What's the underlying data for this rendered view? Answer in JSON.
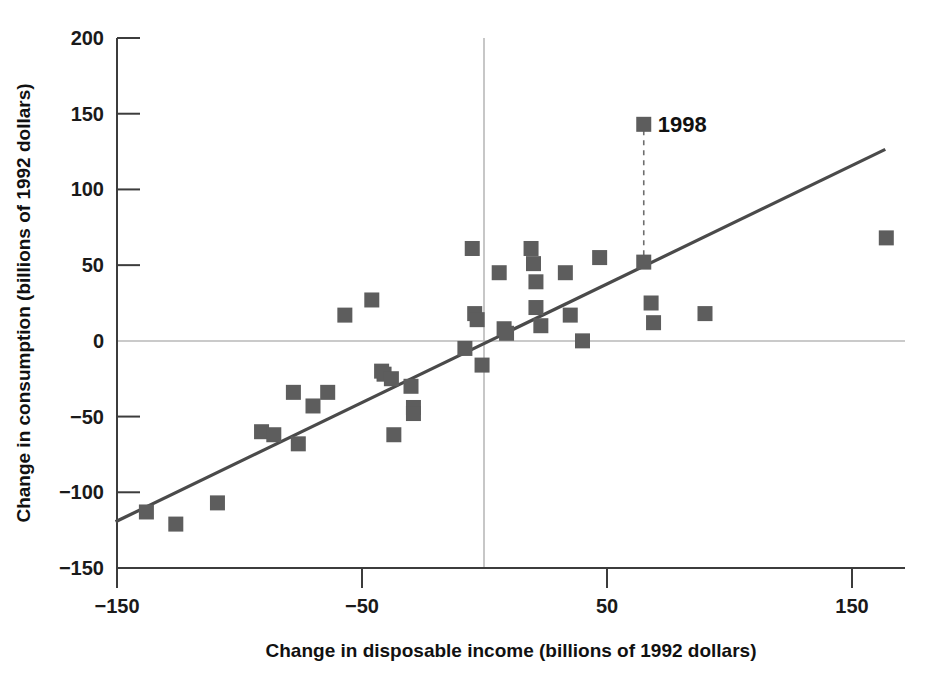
{
  "chart_data": {
    "type": "scatter",
    "title": "",
    "xlabel": "Change in disposable income (billions of 1992 dollars)",
    "ylabel": "Change in consumption (billions of 1992 dollars)",
    "xlim": [
      -150,
      170
    ],
    "ylim": [
      -150,
      200
    ],
    "xticks": [
      -150,
      -50,
      50,
      150
    ],
    "xtick_labels": [
      "-150",
      "-50",
      "50",
      "150"
    ],
    "yticks": [
      200,
      150,
      100,
      50,
      0,
      -50,
      -100,
      -150
    ],
    "ytick_labels": [
      "200",
      "150",
      "100",
      "50",
      "0",
      "-50",
      "-100",
      "-150"
    ],
    "grid": false,
    "legend": false,
    "zero_lines": {
      "x": 0,
      "y": 0
    },
    "marker": "square",
    "marker_color": "#5d5d5d",
    "points": [
      {
        "x": -138,
        "y": -113
      },
      {
        "x": -126,
        "y": -121
      },
      {
        "x": -109,
        "y": -107
      },
      {
        "x": -91,
        "y": -60
      },
      {
        "x": -86,
        "y": -62
      },
      {
        "x": -78,
        "y": -34
      },
      {
        "x": -76,
        "y": -68
      },
      {
        "x": -70,
        "y": -43
      },
      {
        "x": -64,
        "y": -34
      },
      {
        "x": -57,
        "y": 17
      },
      {
        "x": -46,
        "y": 27
      },
      {
        "x": -42,
        "y": -20
      },
      {
        "x": -41,
        "y": -22
      },
      {
        "x": -38,
        "y": -25
      },
      {
        "x": -37,
        "y": -62
      },
      {
        "x": -30,
        "y": -30
      },
      {
        "x": -29,
        "y": -44
      },
      {
        "x": -29,
        "y": -48
      },
      {
        "x": -8,
        "y": -5
      },
      {
        "x": -5,
        "y": 61
      },
      {
        "x": -4,
        "y": 18
      },
      {
        "x": -3,
        "y": 14
      },
      {
        "x": -1,
        "y": -16
      },
      {
        "x": 6,
        "y": 45
      },
      {
        "x": 8,
        "y": 8
      },
      {
        "x": 9,
        "y": 5
      },
      {
        "x": 19,
        "y": 61
      },
      {
        "x": 20,
        "y": 51
      },
      {
        "x": 21,
        "y": 39
      },
      {
        "x": 21,
        "y": 22
      },
      {
        "x": 23,
        "y": 10
      },
      {
        "x": 33,
        "y": 45
      },
      {
        "x": 35,
        "y": 17
      },
      {
        "x": 40,
        "y": 0
      },
      {
        "x": 47,
        "y": 55
      },
      {
        "x": 65,
        "y": 52
      },
      {
        "x": 68,
        "y": 25
      },
      {
        "x": 69,
        "y": 12
      },
      {
        "x": 90,
        "y": 18
      },
      {
        "x": 164,
        "y": 68
      }
    ],
    "trend_line": {
      "x_start": -150,
      "y_start": -119,
      "x_end": 163,
      "y_end": 126,
      "color": "#4a4a4a"
    },
    "annotations": [
      {
        "label": "1998",
        "point_x": 65,
        "point_y": 52,
        "label_x": 65,
        "label_y": 143,
        "leader": "dashed-vertical"
      }
    ]
  },
  "colors": {
    "marker": "#5d5d5d",
    "trend": "#4a4a4a",
    "axis": "#3c3c3c",
    "zero_line": "#b9b9b9",
    "text": "#111111",
    "background": "#ffffff"
  }
}
